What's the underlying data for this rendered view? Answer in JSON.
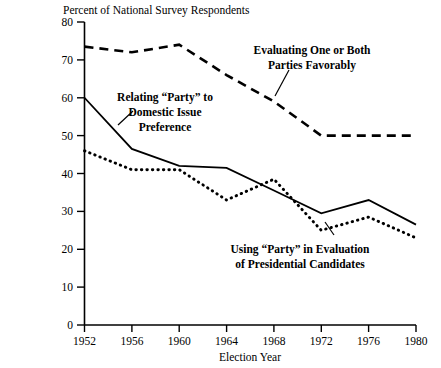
{
  "chart_data": {
    "type": "line",
    "title": "Percent of National Survey Respondents",
    "xlabel": "Election Year",
    "ylabel": "",
    "x": [
      1952,
      1956,
      1960,
      1964,
      1968,
      1972,
      1976,
      1980
    ],
    "categories": [
      "1952",
      "1956",
      "1960",
      "1964",
      "1968",
      "1972",
      "1976",
      "1980"
    ],
    "xlim": [
      1952,
      1980
    ],
    "ylim": [
      0,
      80
    ],
    "ytick_labels": [
      "0",
      "10",
      "20",
      "30",
      "40",
      "50",
      "60",
      "70",
      "80"
    ],
    "yticks": [
      0,
      10,
      20,
      30,
      40,
      50,
      60,
      70,
      80
    ],
    "grid": false,
    "legend_position": "inline-annotations",
    "series": [
      {
        "name": "Evaluating One or Both Parties Favorably",
        "style": "dashed",
        "values": [
          73.5,
          72.0,
          74.0,
          66.0,
          59.0,
          50.0,
          50.0,
          50.0
        ]
      },
      {
        "name": "Relating “Party” to Domestic Issue Preference",
        "style": "solid",
        "values": [
          60.0,
          46.5,
          42.0,
          41.5,
          35.5,
          29.5,
          33.0,
          26.5
        ]
      },
      {
        "name": "Using “Party” in Evaluation of Presidential Candidates",
        "style": "dotted",
        "values": [
          46.0,
          41.0,
          41.0,
          33.0,
          38.5,
          25.0,
          28.5,
          23.0
        ]
      }
    ],
    "annotations": [
      {
        "id": "annot-evaluating",
        "lines": [
          "Evaluating One or Both",
          "Parties Favorably"
        ],
        "align": "center"
      },
      {
        "id": "annot-relating",
        "lines": [
          "Relating “Party” to",
          "Domestic Issue",
          "Preference"
        ],
        "align": "center"
      },
      {
        "id": "annot-using",
        "lines": [
          "Using “Party” in Evaluation",
          "of Presidential Candidates"
        ],
        "align": "center"
      }
    ],
    "colors": {
      "line": "#000000",
      "axis": "#000000",
      "background": "#ffffff"
    }
  }
}
